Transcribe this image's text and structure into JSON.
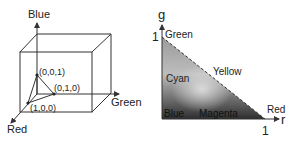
{
  "left_figure": {
    "title": "RGB cube",
    "axes": {
      "blue": "Blue",
      "green": "Green",
      "red": "Red"
    },
    "points": [
      {
        "label": "(0,0,1)"
      },
      {
        "label": "(0,1,0)"
      },
      {
        "label": "(1,0,0)"
      }
    ]
  },
  "right_figure": {
    "title": "rg chromaticity",
    "axes": {
      "y": "g",
      "x": "r",
      "y_max": "1",
      "x_max": "1"
    },
    "regions": {
      "green": "Green",
      "cyan": "Cyan",
      "yellow": "Yellow",
      "blue": "Blue",
      "magenta": "Magenta",
      "red": "Red"
    }
  },
  "colors": {
    "line": "#333333",
    "text": "#222222",
    "triangle_light": "#d8d8d8",
    "triangle_dark": "#3a3a3a"
  }
}
